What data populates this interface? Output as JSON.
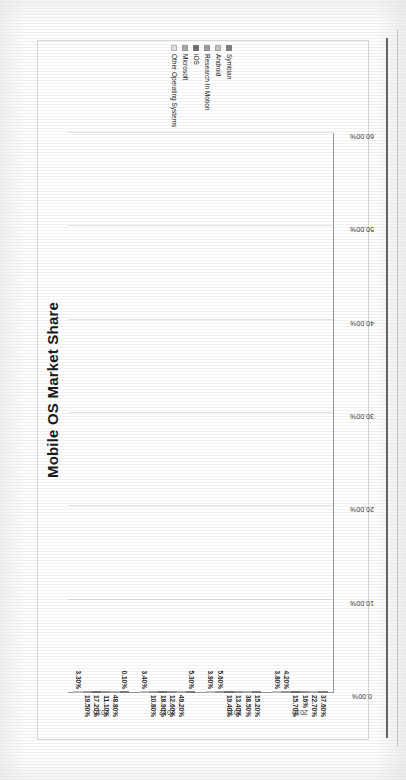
{
  "chart_data": {
    "type": "bar",
    "orientation": "horizontal",
    "title": "Mobile OS Market Share",
    "xlabel": "",
    "ylabel": "",
    "xlim": [
      0,
      60
    ],
    "grid": true,
    "legend_position": "right",
    "axis_ticks": [
      "0.00%",
      "10.00%",
      "20.00%",
      "30.00%",
      "40.00%",
      "50.00%",
      "60.00%"
    ],
    "axis_tick_values": [
      0,
      10,
      20,
      30,
      40,
      50,
      60
    ],
    "categories": [
      "2010",
      "2011",
      "2012",
      "2015"
    ],
    "series": [
      {
        "name": "Symbian",
        "color": "#808080",
        "values": [
          37.6,
          15.2,
          5.3,
          0.1
        ]
      },
      {
        "name": "Android",
        "color": "#c8c8c8",
        "values": [
          22.7,
          38.5,
          49.2,
          48.8
        ]
      },
      {
        "name": "Research In Motion",
        "color": "#9e9e9e",
        "values": [
          16.0,
          13.4,
          12.6,
          11.1
        ]
      },
      {
        "name": "iOS",
        "color": "#6e6e6e",
        "values": [
          15.7,
          19.4,
          18.9,
          17.2
        ]
      },
      {
        "name": "Microsoft",
        "color": "#adadad",
        "values": [
          4.2,
          5.6,
          10.8,
          19.5
        ]
      },
      {
        "name": "Other Operating Systems",
        "color": "#e2e2e2",
        "values": [
          3.8,
          3.9,
          3.4,
          3.3
        ]
      }
    ],
    "value_labels": {
      "2010": [
        "37.60%",
        "22.70%",
        "16%",
        "15.70%",
        "4.20%",
        "3.80%"
      ],
      "2011": [
        "15.20%",
        "38.50%",
        "13.40%",
        "19.40%",
        "5.60%",
        "3.90%"
      ],
      "2012": [
        "5.30%",
        "49.20%",
        "12.60%",
        "18.90%",
        "10.80%",
        "3.40%"
      ],
      "2015": [
        "0.10%",
        "48.80%",
        "11.10%",
        "17.20%",
        "19.50%",
        "3.30%"
      ]
    }
  },
  "legend": {
    "items": [
      {
        "label": "Symbian"
      },
      {
        "label": "Android"
      },
      {
        "label": "Research In Motion"
      },
      {
        "label": "iOS"
      },
      {
        "label": "Microsoft"
      },
      {
        "label": "Other Operating Systems"
      }
    ]
  },
  "colors": {
    "symbian": "#808080",
    "android": "#c8c8c8",
    "rim": "#9e9e9e",
    "ios": "#6e6e6e",
    "microsoft": "#adadad",
    "other": "#e2e2e2",
    "gridline": "#dfe3e6",
    "axis": "#9a9a9a",
    "text": "#1b1b1b"
  }
}
